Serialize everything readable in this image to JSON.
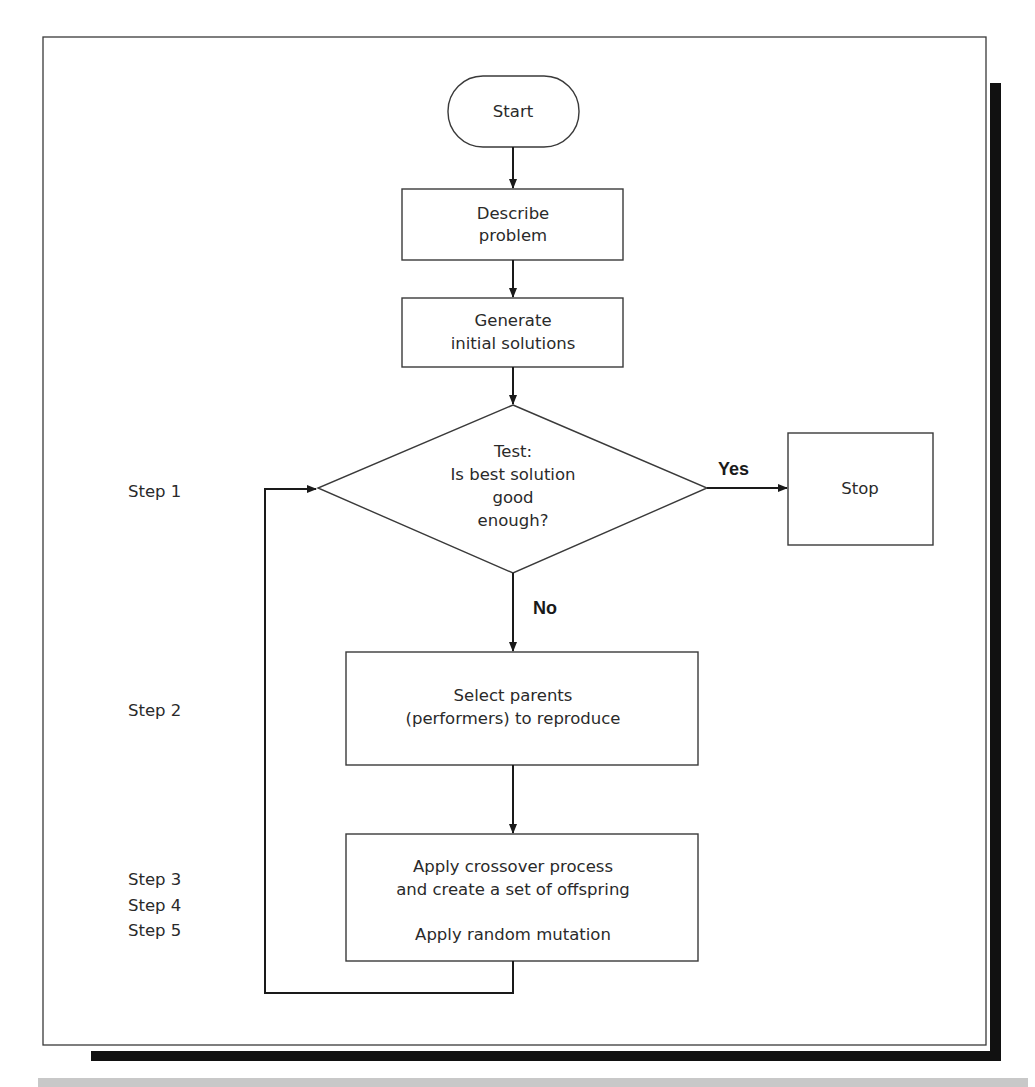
{
  "diagram": {
    "type": "flowchart",
    "nodes": {
      "start": {
        "label": "Start",
        "shape": "terminator"
      },
      "describe": {
        "line1": "Describe",
        "line2": "problem",
        "shape": "process"
      },
      "generate": {
        "line1": "Generate",
        "line2": "initial solutions",
        "shape": "process"
      },
      "test": {
        "line1": "Test:",
        "line2": "Is best solution",
        "line3": "good",
        "line4": "enough?",
        "shape": "decision"
      },
      "stop": {
        "label": "Stop",
        "shape": "process"
      },
      "select": {
        "line1": "Select parents",
        "line2": "(performers) to reproduce",
        "shape": "process"
      },
      "apply": {
        "line1": "Apply crossover process",
        "line2": "and create a set of offspring",
        "line3": "Apply random mutation",
        "shape": "process"
      }
    },
    "edges": {
      "yes_label": "Yes",
      "no_label": "No"
    },
    "steps": {
      "step1": "Step 1",
      "step2": "Step 2",
      "step3": "Step 3",
      "step4": "Step 4",
      "step5": "Step 5"
    },
    "colors": {
      "stroke": "#1a1a1a",
      "shadow": "#111111",
      "footer_band": "#c8c8c8"
    }
  }
}
